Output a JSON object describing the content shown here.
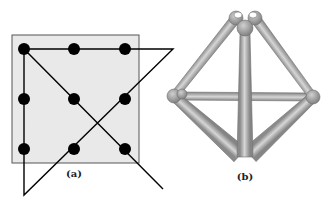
{
  "panels": [
    {
      "id": "a",
      "caption": "(a)",
      "caption_pos": [
        74,
        168
      ],
      "box": {
        "x": 12,
        "y": 35,
        "w": 127,
        "h": 128,
        "fill": "#e9e9e9",
        "stroke": "#555555"
      },
      "dots": [
        [
          24,
          49
        ],
        [
          74,
          49
        ],
        [
          125,
          49
        ],
        [
          24,
          99
        ],
        [
          74,
          99
        ],
        [
          125,
          99
        ],
        [
          24,
          149
        ],
        [
          74,
          149
        ],
        [
          125,
          149
        ]
      ],
      "dot_radius": 6,
      "dot_color": "#000000",
      "path": [
        [
          24,
          49
        ],
        [
          173,
          49
        ],
        [
          24,
          195
        ],
        [
          24,
          49
        ],
        [
          163,
          189
        ]
      ],
      "path_color": "#000000"
    },
    {
      "id": "b",
      "caption": "(b)",
      "caption_pos": [
        245,
        171
      ],
      "nodes": {
        "top": [
          245,
          28
        ],
        "top_left_lobe": [
          236,
          18
        ],
        "top_right_lobe": [
          255,
          18
        ],
        "left": [
          174,
          96
        ],
        "right": [
          313,
          97
        ],
        "bottom_left": [
          240,
          155
        ],
        "bottom_right": [
          250,
          155
        ]
      },
      "rod_color": "#b5b5b5",
      "node_color": "#9a9a9a",
      "edge_color": "#6f6f6f"
    }
  ]
}
